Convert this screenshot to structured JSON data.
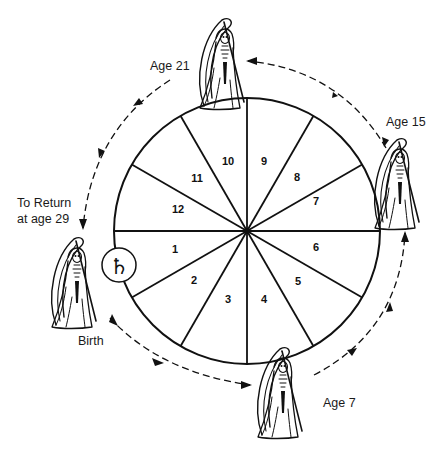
{
  "diagram": {
    "wheel": {
      "center": [
        247,
        231
      ],
      "radius": 133,
      "house_numbers": [
        "1",
        "2",
        "3",
        "4",
        "5",
        "6",
        "7",
        "8",
        "9",
        "10",
        "11",
        "12"
      ]
    },
    "planet_symbol": "♄",
    "planet_name": "Saturn",
    "labels": {
      "birth": "Birth",
      "age7": "Age 7",
      "age15": "Age 15",
      "age21": "Age 21",
      "return_line1": "To Return",
      "return_line2": "at age 29"
    },
    "figures": [
      "grim-reaper-birth",
      "grim-reaper-age-7",
      "grim-reaper-age-15",
      "grim-reaper-age-21"
    ],
    "colors": {
      "ink": "#111111",
      "background": "#ffffff"
    }
  }
}
